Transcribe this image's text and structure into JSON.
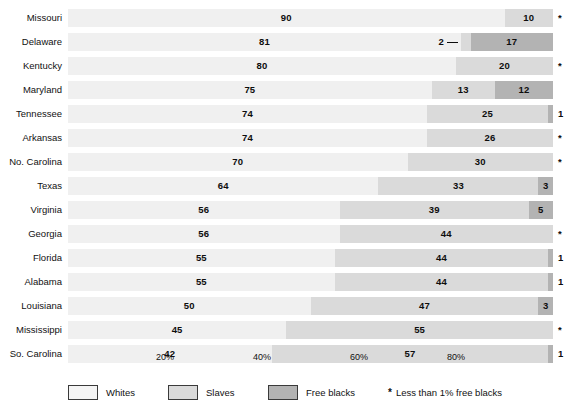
{
  "chart_data": {
    "type": "bar",
    "subtype": "stacked-horizontal-100pct",
    "title": "",
    "subtitle": "",
    "xlabel": "",
    "ylabel": "",
    "xlim": [
      0,
      100
    ],
    "grid": false,
    "legend_position": "bottom",
    "categories": [
      "Missouri",
      "Delaware",
      "Kentucky",
      "Maryland",
      "Tennessee",
      "Arkansas",
      "No. Carolina",
      "Texas",
      "Virginia",
      "Georgia",
      "Florida",
      "Alabama",
      "Louisiana",
      "Mississippi",
      "So. Carolina"
    ],
    "series": [
      {
        "name": "Whites",
        "color": "#f0f0f0",
        "values": [
          90,
          81,
          80,
          75,
          74,
          74,
          70,
          64,
          56,
          56,
          55,
          55,
          50,
          45,
          42
        ]
      },
      {
        "name": "Slaves",
        "color": "#dadada",
        "values": [
          10,
          2,
          20,
          13,
          25,
          26,
          30,
          33,
          39,
          44,
          44,
          44,
          47,
          55,
          57
        ]
      },
      {
        "name": "Free blacks",
        "color": "#b3b3b3",
        "values": [
          0,
          17,
          0,
          12,
          1,
          0,
          0,
          3,
          5,
          0,
          1,
          1,
          3,
          0,
          1
        ]
      }
    ],
    "xticks": [
      20,
      40,
      60,
      80
    ],
    "xticklabels": [
      "20%",
      "40%",
      "60%",
      "80%"
    ],
    "row_markers": [
      "*",
      "",
      "*",
      "",
      "1",
      "*",
      "*",
      "",
      "",
      "*",
      "1",
      "1",
      "",
      "*",
      "1"
    ],
    "annotations": [
      {
        "row": "Delaware",
        "text": "2",
        "kind": "leader-line",
        "series": "Slaves"
      }
    ],
    "legend": [
      {
        "label": "Whites",
        "color": "#f4f4f4"
      },
      {
        "label": "Slaves",
        "color": "#dadada"
      },
      {
        "label": "Free blacks",
        "color": "#b3b3b3"
      }
    ],
    "footnote": "Less than 1% free blacks",
    "footnote_symbol": "*"
  },
  "rows": [
    {
      "label": "Missouri",
      "whites": 90,
      "slaves": 10,
      "free": 0,
      "whites_label": "90",
      "slaves_label": "10",
      "free_label": "",
      "marker": "*",
      "callout": ""
    },
    {
      "label": "Delaware",
      "whites": 81,
      "slaves": 2,
      "free": 17,
      "whites_label": "81",
      "slaves_label": "",
      "free_label": "17",
      "marker": "",
      "callout": "2"
    },
    {
      "label": "Kentucky",
      "whites": 80,
      "slaves": 20,
      "free": 0,
      "whites_label": "80",
      "slaves_label": "20",
      "free_label": "",
      "marker": "*",
      "callout": ""
    },
    {
      "label": "Maryland",
      "whites": 75,
      "slaves": 13,
      "free": 12,
      "whites_label": "75",
      "slaves_label": "13",
      "free_label": "12",
      "marker": "",
      "callout": ""
    },
    {
      "label": "Tennessee",
      "whites": 74,
      "slaves": 25,
      "free": 1,
      "whites_label": "74",
      "slaves_label": "25",
      "free_label": "",
      "marker": "1",
      "callout": ""
    },
    {
      "label": "Arkansas",
      "whites": 74,
      "slaves": 26,
      "free": 0,
      "whites_label": "74",
      "slaves_label": "26",
      "free_label": "",
      "marker": "*",
      "callout": ""
    },
    {
      "label": "No. Carolina",
      "whites": 70,
      "slaves": 30,
      "free": 0,
      "whites_label": "70",
      "slaves_label": "30",
      "free_label": "",
      "marker": "*",
      "callout": ""
    },
    {
      "label": "Texas",
      "whites": 64,
      "slaves": 33,
      "free": 3,
      "whites_label": "64",
      "slaves_label": "33",
      "free_label": "3",
      "marker": "",
      "callout": ""
    },
    {
      "label": "Virginia",
      "whites": 56,
      "slaves": 39,
      "free": 5,
      "whites_label": "56",
      "slaves_label": "39",
      "free_label": "5",
      "marker": "",
      "callout": ""
    },
    {
      "label": "Georgia",
      "whites": 56,
      "slaves": 44,
      "free": 0,
      "whites_label": "56",
      "slaves_label": "44",
      "free_label": "",
      "marker": "*",
      "callout": ""
    },
    {
      "label": "Florida",
      "whites": 55,
      "slaves": 44,
      "free": 1,
      "whites_label": "55",
      "slaves_label": "44",
      "free_label": "",
      "marker": "1",
      "callout": ""
    },
    {
      "label": "Alabama",
      "whites": 55,
      "slaves": 44,
      "free": 1,
      "whites_label": "55",
      "slaves_label": "44",
      "free_label": "",
      "marker": "1",
      "callout": ""
    },
    {
      "label": "Louisiana",
      "whites": 50,
      "slaves": 47,
      "free": 3,
      "whites_label": "50",
      "slaves_label": "47",
      "free_label": "3",
      "marker": "",
      "callout": ""
    },
    {
      "label": "Mississippi",
      "whites": 45,
      "slaves": 55,
      "free": 0,
      "whites_label": "45",
      "slaves_label": "55",
      "free_label": "",
      "marker": "*",
      "callout": ""
    },
    {
      "label": "So. Carolina",
      "whites": 42,
      "slaves": 57,
      "free": 1,
      "whites_label": "42",
      "slaves_label": "57",
      "free_label": "",
      "marker": "1",
      "callout": ""
    }
  ],
  "axis": {
    "ticks": [
      {
        "value": 20,
        "label": "20%"
      },
      {
        "value": 40,
        "label": "40%"
      },
      {
        "value": 60,
        "label": "60%"
      },
      {
        "value": 80,
        "label": "80%"
      }
    ]
  },
  "legend": {
    "whites_label": "Whites",
    "slaves_label": "Slaves",
    "free_label": "Free blacks",
    "note_symbol": "*",
    "note_text": "Less than 1% free blacks"
  },
  "colors": {
    "whites": "#f0f0f0",
    "slaves": "#dadada",
    "free": "#b3b3b3",
    "text": "#111111"
  }
}
